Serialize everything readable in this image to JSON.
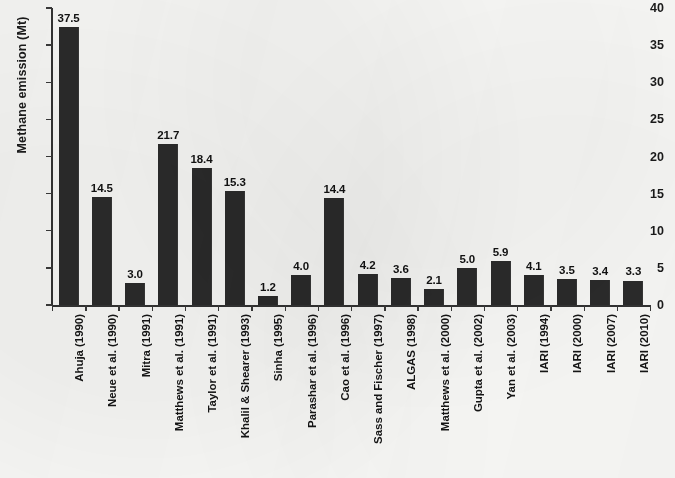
{
  "chart_data": {
    "type": "bar",
    "title": "",
    "xlabel": "",
    "ylabel": "Methane emission (Mt)",
    "ylim": [
      0,
      40
    ],
    "yticks": [
      0,
      5,
      10,
      15,
      20,
      25,
      30,
      35,
      40
    ],
    "grid": false,
    "legend": null,
    "bar_color": "#2b2b2b",
    "background_color": "#fbfbf9",
    "value_labels_shown": true,
    "categories": [
      "Ahuja (1990)",
      "Neue et al. (1990)",
      "Mitra (1991)",
      "Matthews et al. (1991)",
      "Taylor et al. (1991)",
      "Khalil & Shearer (1993)",
      "Sinha (1995)",
      "Parashar et al. (1996)",
      "Cao et al. (1996)",
      "Sass and Fischer (1997)",
      "ALGAS (1998)",
      "Matthews et al. (2000)",
      "Gupta et al. (2002)",
      "Yan et al. (2003)",
      "IARI (1994)",
      "IARI (2000)",
      "IARI (2007)",
      "IARI (2010)"
    ],
    "values": [
      37.5,
      14.5,
      3.0,
      21.7,
      18.4,
      15.3,
      1.2,
      4.0,
      14.4,
      4.2,
      3.6,
      2.1,
      5.0,
      5.9,
      4.1,
      3.5,
      3.4,
      3.3
    ],
    "value_labels": [
      "37.5",
      "14.5",
      "3.0",
      "21.7",
      "18.4",
      "15.3",
      "1.2",
      "4.0",
      "14.4",
      "4.2",
      "3.6",
      "2.1",
      "5.0",
      "5.9",
      "4.1",
      "3.5",
      "3.4",
      "3.3"
    ],
    "ytick_labels": [
      "0",
      "5",
      "10",
      "15",
      "20",
      "25",
      "30",
      "35",
      "40"
    ]
  }
}
